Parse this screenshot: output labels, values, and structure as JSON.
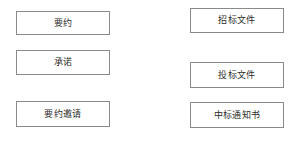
{
  "diagram": {
    "title": "",
    "background_color": "#ffffff",
    "border_color": "#8a8a8a",
    "text_color": "#2b2b2b",
    "columns": [
      {
        "name": "left-column",
        "nodes": [
          {
            "id": "offer",
            "label": "要约"
          },
          {
            "id": "acceptance",
            "label": "承诺"
          },
          {
            "id": "invitation-offer",
            "label": "要约邀请"
          }
        ]
      },
      {
        "name": "right-column",
        "nodes": [
          {
            "id": "tender-document",
            "label": "招标文件"
          },
          {
            "id": "bid-document",
            "label": "投标文件"
          },
          {
            "id": "award-notice",
            "label": "中标通知书"
          }
        ]
      }
    ]
  }
}
